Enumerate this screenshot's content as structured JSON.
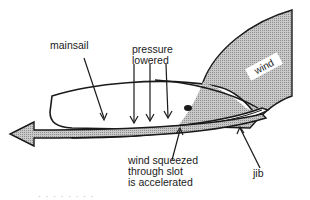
{
  "diagram": {
    "colors": {
      "ink": "#1a1a1a",
      "wind_fill": "#b8b8b8",
      "arrow_fill": "#a9a9a9",
      "background": "#ffffff"
    },
    "labels": {
      "mainsail": "mainsail",
      "pressure_lowered": [
        "pressure",
        "lowered"
      ],
      "wind": "wind",
      "wind_squeezed": [
        "wind squeezed",
        "through slot",
        "is accelerated"
      ],
      "jib": "jib"
    },
    "arrows": {
      "pressure_arrows_count": 4,
      "main_flow_direction": "left"
    },
    "caption_partial": "· ·  ·  · ·   · ·  ·"
  }
}
